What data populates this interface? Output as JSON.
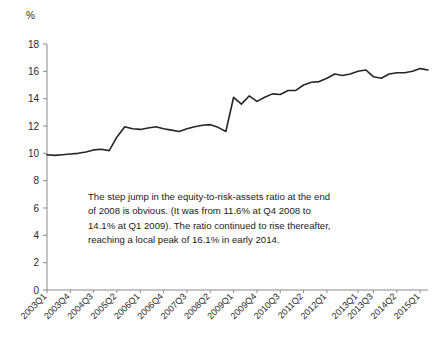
{
  "chart_data": {
    "type": "line",
    "title": "",
    "subtitle": "",
    "xlabel": "",
    "ylabel": "",
    "unit_label": "%",
    "ylim": [
      0,
      18
    ],
    "ytick_values": [
      0,
      2,
      4,
      6,
      8,
      10,
      12,
      14,
      16,
      18
    ],
    "ytick_labels": [
      "0",
      "2",
      "4",
      "6",
      "8",
      "10",
      "12",
      "14",
      "16",
      "18"
    ],
    "grid": false,
    "legend": null,
    "legend_position": "none",
    "line_color": "#262626",
    "xtick_labels": [
      "2003Q1",
      "2003Q4",
      "2004Q3",
      "2005Q2",
      "2006Q1",
      "2006Q4",
      "2007Q3",
      "2008Q2",
      "2009Q1",
      "2009Q4",
      "2010Q3",
      "2011Q2",
      "2012Q1",
      "2013Q1",
      "2013Q3",
      "2014Q2",
      "2015Q1"
    ],
    "xtick_indices": [
      0,
      3,
      6,
      9,
      12,
      15,
      18,
      21,
      24,
      27,
      30,
      33,
      36,
      40,
      42,
      45,
      48
    ],
    "x": [
      "2003Q1",
      "2003Q2",
      "2003Q3",
      "2003Q4",
      "2004Q1",
      "2004Q2",
      "2004Q3",
      "2004Q4",
      "2005Q1",
      "2005Q2",
      "2005Q3",
      "2005Q4",
      "2006Q1",
      "2006Q2",
      "2006Q3",
      "2006Q4",
      "2007Q1",
      "2007Q2",
      "2007Q3",
      "2007Q4",
      "2008Q1",
      "2008Q2",
      "2008Q3",
      "2008Q4",
      "2009Q1",
      "2009Q2",
      "2009Q3",
      "2009Q4",
      "2010Q1",
      "2010Q2",
      "2010Q3",
      "2010Q4",
      "2011Q1",
      "2011Q2",
      "2011Q3",
      "2011Q4",
      "2012Q1",
      "2012Q2",
      "2012Q3",
      "2012Q4",
      "2013Q1",
      "2013Q2",
      "2013Q3",
      "2013Q4",
      "2014Q1",
      "2014Q2",
      "2014Q3",
      "2014Q4",
      "2015Q1",
      "2015Q2"
    ],
    "values": [
      9.9,
      9.85,
      9.9,
      9.95,
      10.0,
      10.1,
      10.25,
      10.3,
      10.2,
      11.2,
      11.95,
      11.8,
      11.75,
      11.85,
      11.95,
      11.8,
      11.7,
      11.6,
      11.8,
      11.95,
      12.05,
      12.1,
      11.9,
      11.6,
      14.1,
      13.6,
      14.2,
      13.8,
      14.1,
      14.35,
      14.3,
      14.6,
      14.6,
      15.0,
      15.2,
      15.25,
      15.5,
      15.8,
      15.7,
      15.8,
      16.0,
      16.1,
      15.6,
      15.5,
      15.8,
      15.9,
      15.9,
      16.0,
      16.2,
      16.1
    ]
  },
  "annotation": {
    "line1": "The step jump in the equity-to-risk-assets ratio at the end",
    "line2": "of 2008 is obvious. (It was from 11.6% at Q4 2008 to",
    "line3": "14.1% at Q1 2009). The ratio continued to rise thereafter,",
    "line4": "reaching a local peak of 16.1% in early 2014."
  }
}
